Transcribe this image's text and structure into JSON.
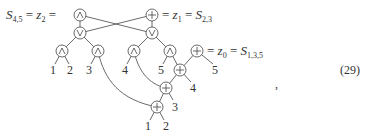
{
  "diagram": {
    "type": "boolean-circuit-tree",
    "equation_number": "(29)",
    "trailing_punct": ",",
    "labels": {
      "top_left": {
        "lhs": "S",
        "lhs_sub": "4,5",
        "mid": "z",
        "mid_sub": "2"
      },
      "top_right": {
        "mid": "z",
        "mid_sub": "1",
        "rhs": "S",
        "rhs_sub": "2,3"
      },
      "mid_right": {
        "mid": "z",
        "mid_sub": "0",
        "rhs": "S",
        "rhs_sub": "1,3,5"
      }
    },
    "nodes": [
      {
        "id": "n_and_top",
        "symbol": "∧",
        "x": 80,
        "y": 15
      },
      {
        "id": "n_xor_top",
        "symbol": "+",
        "x": 152,
        "y": 15
      },
      {
        "id": "n_or_left",
        "symbol": "∨",
        "x": 80,
        "y": 33
      },
      {
        "id": "n_or_right",
        "symbol": "∨",
        "x": 152,
        "y": 33
      },
      {
        "id": "n_and_12",
        "symbol": "∧",
        "x": 62,
        "y": 51
      },
      {
        "id": "n_and_3",
        "symbol": "∧",
        "x": 98,
        "y": 51
      },
      {
        "id": "n_and_4",
        "symbol": "∧",
        "x": 134,
        "y": 51
      },
      {
        "id": "n_and_5",
        "symbol": "∧",
        "x": 170,
        "y": 51
      },
      {
        "id": "n_xor_z0",
        "symbol": "+",
        "x": 197,
        "y": 51
      },
      {
        "id": "n_xor_a",
        "symbol": "+",
        "x": 180,
        "y": 70
      },
      {
        "id": "n_xor_b",
        "symbol": "+",
        "x": 166,
        "y": 88
      },
      {
        "id": "n_xor_c",
        "symbol": "+",
        "x": 157,
        "y": 107
      }
    ],
    "leaves": [
      {
        "text": "1",
        "x": 53,
        "y": 74
      },
      {
        "text": "2",
        "x": 70,
        "y": 74
      },
      {
        "text": "3",
        "x": 89,
        "y": 74
      },
      {
        "text": "4",
        "x": 125,
        "y": 74
      },
      {
        "text": "5",
        "x": 161,
        "y": 74
      },
      {
        "text": "5",
        "x": 215,
        "y": 74
      },
      {
        "text": "4",
        "x": 193,
        "y": 92
      },
      {
        "text": "3",
        "x": 175,
        "y": 111
      },
      {
        "text": "1",
        "x": 148,
        "y": 130
      },
      {
        "text": "2",
        "x": 166,
        "y": 130
      }
    ]
  }
}
